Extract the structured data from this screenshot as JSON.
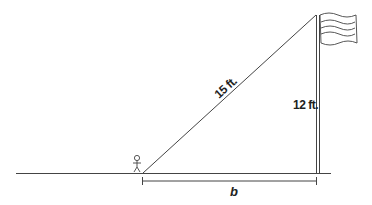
{
  "diagram": {
    "type": "right-triangle word problem",
    "labels": {
      "hypotenuse": "15 ft.",
      "height": "12 ft.",
      "base": "b"
    },
    "elements": [
      "ground-line",
      "flagpole",
      "flag",
      "stick-figure",
      "hypotenuse-line",
      "base-dimension-line"
    ],
    "colors": {
      "line": "#444444",
      "text": "#222222",
      "background": "#ffffff"
    }
  }
}
